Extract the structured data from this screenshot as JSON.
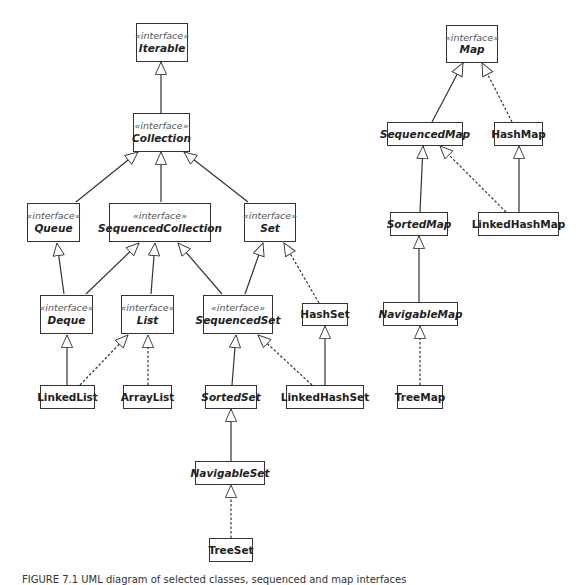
{
  "diagram": {
    "type": "uml-class-diagram",
    "stereotype_label": "«interface»",
    "nodes": [
      {
        "id": "iterable",
        "name": "Iterable",
        "interface": true,
        "abstract": true
      },
      {
        "id": "collection",
        "name": "Collection",
        "interface": true,
        "abstract": true
      },
      {
        "id": "queue",
        "name": "Queue",
        "interface": true,
        "abstract": true
      },
      {
        "id": "sequencedcollection",
        "name": "SequencedCollection",
        "interface": true,
        "abstract": true
      },
      {
        "id": "set",
        "name": "Set",
        "interface": true,
        "abstract": true
      },
      {
        "id": "deque",
        "name": "Deque",
        "interface": true,
        "abstract": true
      },
      {
        "id": "list",
        "name": "List",
        "interface": true,
        "abstract": true
      },
      {
        "id": "sequencedset",
        "name": "SequencedSet",
        "interface": true,
        "abstract": true
      },
      {
        "id": "hashset",
        "name": "HashSet",
        "interface": false,
        "abstract": false
      },
      {
        "id": "linkedlist",
        "name": "LinkedList",
        "interface": false,
        "abstract": false
      },
      {
        "id": "arraylist",
        "name": "ArrayList",
        "interface": false,
        "abstract": false
      },
      {
        "id": "sortedset",
        "name": "SortedSet",
        "interface": false,
        "abstract": true
      },
      {
        "id": "linkedhashset",
        "name": "LinkedHashSet",
        "interface": false,
        "abstract": false
      },
      {
        "id": "navigableset",
        "name": "NavigableSet",
        "interface": false,
        "abstract": true
      },
      {
        "id": "treeset",
        "name": "TreeSet",
        "interface": false,
        "abstract": false
      },
      {
        "id": "map",
        "name": "Map",
        "interface": true,
        "abstract": true
      },
      {
        "id": "sequencedmap",
        "name": "SequencedMap",
        "interface": false,
        "abstract": true
      },
      {
        "id": "hashmap",
        "name": "HashMap",
        "interface": false,
        "abstract": false
      },
      {
        "id": "sortedmap",
        "name": "SortedMap",
        "interface": false,
        "abstract": true
      },
      {
        "id": "linkedhashmap",
        "name": "LinkedHashMap",
        "interface": false,
        "abstract": false
      },
      {
        "id": "navigablemap",
        "name": "NavigableMap",
        "interface": false,
        "abstract": true
      },
      {
        "id": "treemap",
        "name": "TreeMap",
        "interface": false,
        "abstract": false
      }
    ],
    "edges": [
      {
        "from": "collection",
        "to": "iterable",
        "kind": "extends",
        "style": "solid"
      },
      {
        "from": "queue",
        "to": "collection",
        "kind": "extends",
        "style": "solid"
      },
      {
        "from": "sequencedcollection",
        "to": "collection",
        "kind": "extends",
        "style": "solid"
      },
      {
        "from": "set",
        "to": "collection",
        "kind": "extends",
        "style": "solid"
      },
      {
        "from": "deque",
        "to": "queue",
        "kind": "extends",
        "style": "solid"
      },
      {
        "from": "deque",
        "to": "sequencedcollection",
        "kind": "extends",
        "style": "solid"
      },
      {
        "from": "list",
        "to": "sequencedcollection",
        "kind": "extends",
        "style": "solid"
      },
      {
        "from": "sequencedset",
        "to": "sequencedcollection",
        "kind": "extends",
        "style": "solid"
      },
      {
        "from": "sequencedset",
        "to": "set",
        "kind": "extends",
        "style": "solid"
      },
      {
        "from": "hashset",
        "to": "set",
        "kind": "implements",
        "style": "dashed"
      },
      {
        "from": "linkedlist",
        "to": "deque",
        "kind": "implements",
        "style": "solid"
      },
      {
        "from": "linkedlist",
        "to": "list",
        "kind": "implements",
        "style": "dashed"
      },
      {
        "from": "arraylist",
        "to": "list",
        "kind": "implements",
        "style": "dashed"
      },
      {
        "from": "sortedset",
        "to": "sequencedset",
        "kind": "extends",
        "style": "solid"
      },
      {
        "from": "linkedhashset",
        "to": "sequencedset",
        "kind": "implements",
        "style": "dashed"
      },
      {
        "from": "linkedhashset",
        "to": "hashset",
        "kind": "extends",
        "style": "solid"
      },
      {
        "from": "navigableset",
        "to": "sortedset",
        "kind": "extends",
        "style": "solid"
      },
      {
        "from": "treeset",
        "to": "navigableset",
        "kind": "implements",
        "style": "dashed"
      },
      {
        "from": "sequencedmap",
        "to": "map",
        "kind": "extends",
        "style": "solid"
      },
      {
        "from": "hashmap",
        "to": "map",
        "kind": "implements",
        "style": "dashed"
      },
      {
        "from": "sortedmap",
        "to": "sequencedmap",
        "kind": "extends",
        "style": "solid"
      },
      {
        "from": "linkedhashmap",
        "to": "sequencedmap",
        "kind": "implements",
        "style": "dashed"
      },
      {
        "from": "linkedhashmap",
        "to": "hashmap",
        "kind": "extends",
        "style": "solid"
      },
      {
        "from": "navigablemap",
        "to": "sortedmap",
        "kind": "extends",
        "style": "solid"
      },
      {
        "from": "treemap",
        "to": "navigablemap",
        "kind": "implements",
        "style": "dashed"
      }
    ]
  },
  "caption": {
    "text": "FIGURE 7.1 UML diagram of selected classes, sequenced and map interfaces",
    "partially_visible": true
  },
  "colors": {
    "line": "#333333",
    "box_border": "#333333",
    "stereotype_text": "#555555",
    "background": "#ffffff"
  }
}
